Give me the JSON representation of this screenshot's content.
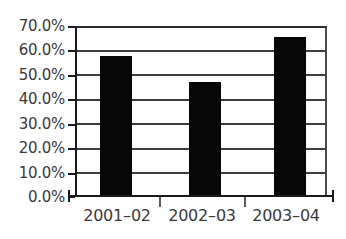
{
  "chart_data": {
    "type": "bar",
    "title": "",
    "subtitle": "",
    "xlabel": "",
    "ylabel": "",
    "categories": [
      "2001–02",
      "2002–03",
      "2003–04"
    ],
    "values": [
      58.0,
      47.0,
      66.0
    ],
    "value_labels": [
      "58.0%",
      "47.0%",
      "66.0%"
    ],
    "series": [
      {
        "name": "",
        "values": [
          58.0,
          47.0,
          66.0
        ]
      }
    ],
    "ylim": [
      0,
      70
    ],
    "ytick_values": [
      0,
      10,
      20,
      30,
      40,
      50,
      60,
      70
    ],
    "ytick_labels": [
      "0.0%",
      "10.0%",
      "20.0%",
      "30.0%",
      "40.0%",
      "50.0%",
      "60.0%",
      "70.0%"
    ],
    "xtick_labels": [
      "2001–02",
      "2002–03",
      "2003–04"
    ],
    "grid": true,
    "grid_axis": "y",
    "legend": false,
    "legend_position": "none",
    "annotations": [],
    "bar_color": "#080808",
    "grid_color": "#3c3c3c",
    "axis_color": "#1a1a1a",
    "text_color": "#3a3a3a",
    "background_color": "#ffffff"
  },
  "axis": {
    "y_labels": [
      {
        "text": "70.0%",
        "value": 70
      },
      {
        "text": "60.0%",
        "value": 60
      },
      {
        "text": "50.0%",
        "value": 50
      },
      {
        "text": "40.0%",
        "value": 40
      },
      {
        "text": "30.0%",
        "value": 30
      },
      {
        "text": "20.0%",
        "value": 20
      },
      {
        "text": "10.0%",
        "value": 10
      },
      {
        "text": "0.0%",
        "value": 0
      }
    ],
    "x_labels": [
      {
        "text": "2001–02"
      },
      {
        "text": "2002–03"
      },
      {
        "text": "2003–04"
      }
    ]
  }
}
